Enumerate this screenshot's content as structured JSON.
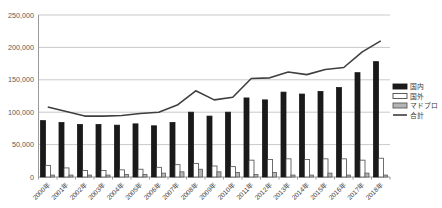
{
  "chart_data": {
    "type": "bar",
    "subtype": "grouped-bars-with-total-line",
    "title": "",
    "xlabel": "",
    "ylabel": "",
    "categories": [
      "2000年",
      "2001年",
      "2002年",
      "2003年",
      "2004年",
      "2005年",
      "2006年",
      "2007年",
      "2008年",
      "2009年",
      "2010年",
      "2011年",
      "2012年",
      "2013年",
      "2014年",
      "2015年",
      "2016年",
      "2017年",
      "2018年"
    ],
    "series": [
      {
        "name": "国内",
        "kind": "bar",
        "fill": "#1a1a1a",
        "stroke": "#1a1a1a",
        "values": [
          87000,
          84000,
          81000,
          81000,
          80000,
          82000,
          79000,
          84000,
          100000,
          94000,
          100000,
          122000,
          119000,
          131000,
          128000,
          132000,
          138000,
          161000,
          178000
        ]
      },
      {
        "name": "国外",
        "kind": "bar",
        "fill": "#ffffff",
        "stroke": "#4a4a4a",
        "values": [
          18000,
          14000,
          10000,
          10000,
          11000,
          12000,
          15000,
          19000,
          21000,
          17000,
          16000,
          26000,
          27000,
          28000,
          27000,
          28000,
          28000,
          26000,
          29000
        ]
      },
      {
        "name": "マドプロ",
        "kind": "bar",
        "fill": "#b4b4b4",
        "stroke": "#5a5a5a",
        "values": [
          3000,
          3000,
          3000,
          3000,
          4000,
          4000,
          6000,
          8000,
          12000,
          8000,
          7000,
          4000,
          7000,
          3000,
          3000,
          6000,
          3000,
          6000,
          3000
        ]
      },
      {
        "name": "合計",
        "kind": "line",
        "color": "#3f3f3f",
        "values": [
          108000,
          101000,
          94000,
          94000,
          95000,
          98000,
          100000,
          111000,
          133000,
          119000,
          123000,
          152000,
          153000,
          162000,
          158000,
          166000,
          169000,
          193000,
          210000
        ]
      }
    ],
    "ylim": [
      0,
      250000
    ],
    "yticks": [
      0,
      50000,
      100000,
      150000,
      200000,
      250000
    ],
    "ytick_labels": [
      "0",
      "50,000",
      "100,000",
      "150,000",
      "200,000",
      "250,000"
    ],
    "grid": true,
    "legend_position": "right",
    "legend_labels": [
      "国内",
      "国外",
      "マドプロ",
      "合計"
    ],
    "colors": {
      "gridline": "#c9c9c9",
      "axis": "#9a9a9a",
      "tick_text": "#595959",
      "line_series": "#3f3f3f"
    }
  }
}
